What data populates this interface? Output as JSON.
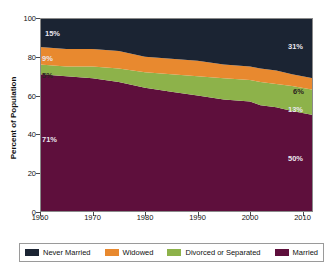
{
  "chart_data": {
    "type": "area",
    "stacked": true,
    "title": "",
    "subtitle": "",
    "xlabel": "",
    "ylabel": "Percent of Population",
    "xlim": [
      1960,
      2012
    ],
    "ylim": [
      0,
      100
    ],
    "grid": false,
    "legend_position": "bottom",
    "x_ticks": [
      "1960",
      "1970",
      "1980",
      "1990",
      "2000",
      "2010"
    ],
    "x_tick_values": [
      1960,
      1970,
      1980,
      1990,
      2000,
      2010
    ],
    "y_ticks": [
      "0",
      "20",
      "40",
      "60",
      "80",
      "100"
    ],
    "y_tick_values": [
      0,
      20,
      40,
      60,
      80,
      100
    ],
    "x": [
      1960,
      1965,
      1970,
      1975,
      1980,
      1985,
      1990,
      1995,
      2000,
      2002,
      2005,
      2008,
      2012
    ],
    "series": [
      {
        "name": "Married",
        "color": "#5e0f3c",
        "stack_order": 1,
        "values": [
          71,
          70,
          69,
          67,
          64,
          62,
          60,
          58,
          57,
          55,
          54,
          52,
          50
        ]
      },
      {
        "name": "Divorced or Separated",
        "color": "#8db24a",
        "stack_order": 2,
        "values": [
          5,
          5,
          6,
          7,
          8,
          9,
          10,
          11,
          11,
          12,
          12,
          13,
          13
        ]
      },
      {
        "name": "Widowed",
        "color": "#e8892f",
        "stack_order": 3,
        "values": [
          9,
          9,
          9,
          9,
          8,
          8,
          8,
          7,
          7,
          7,
          7,
          6,
          6
        ]
      },
      {
        "name": "Never Married",
        "color": "#1b2433",
        "stack_order": 4,
        "values": [
          15,
          16,
          16,
          17,
          20,
          21,
          22,
          24,
          25,
          26,
          27,
          29,
          31
        ]
      }
    ],
    "annotations": [
      {
        "text": "15%",
        "series": "Never Married",
        "side": "left",
        "value": 15,
        "color": "light"
      },
      {
        "text": "9%",
        "series": "Widowed",
        "side": "left",
        "value": 9,
        "color": "light"
      },
      {
        "text": "5%",
        "series": "Divorced or Separated",
        "side": "left",
        "value": 5,
        "color": "dark"
      },
      {
        "text": "71%",
        "series": "Married",
        "side": "left",
        "value": 71,
        "color": "light"
      },
      {
        "text": "31%",
        "series": "Never Married",
        "side": "right",
        "value": 31,
        "color": "light"
      },
      {
        "text": "6%",
        "series": "Widowed",
        "side": "right",
        "value": 6,
        "color": "dark"
      },
      {
        "text": "13%",
        "series": "Divorced or Separated",
        "side": "right",
        "value": 13,
        "color": "light"
      },
      {
        "text": "50%",
        "series": "Married",
        "side": "right",
        "value": 50,
        "color": "light"
      }
    ]
  },
  "axis": {
    "y_title": "Percent of Population",
    "y_labels": [
      "100",
      "80",
      "60",
      "40",
      "20",
      "0"
    ],
    "x_labels": [
      "1960",
      "1970",
      "1980",
      "1990",
      "2000",
      "2010"
    ]
  },
  "labels": {
    "left": {
      "never_married": "15%",
      "widowed": "9%",
      "divorced": "5%",
      "married": "71%"
    },
    "right": {
      "never_married": "31%",
      "widowed": "6%",
      "divorced": "13%",
      "married": "50%"
    }
  },
  "legend": {
    "items": [
      {
        "label": "Never Married",
        "color": "#1b2433"
      },
      {
        "label": "Widowed",
        "color": "#e8892f"
      },
      {
        "label": "Divorced or Separated",
        "color": "#8db24a"
      },
      {
        "label": "Married",
        "color": "#5e0f3c"
      }
    ]
  }
}
